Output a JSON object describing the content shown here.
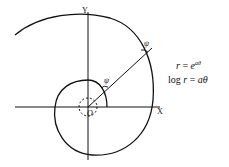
{
  "diagram": {
    "type": "logarithmic-spiral",
    "axes": {
      "x_label": "X",
      "y_label": "Y",
      "origin_label": "O"
    },
    "angle_labels": [
      "ψ",
      "ψ"
    ],
    "equations": {
      "line1_lhs": "r",
      "line1_eq": " = ",
      "line1_base": "e",
      "line1_exp": "aθ",
      "line2_lhs": "log ",
      "line2_var": "r",
      "line2_eq": " = ",
      "line2_rhs": "aθ"
    },
    "colors": {
      "stroke": "#111111",
      "background": "#ffffff"
    }
  }
}
